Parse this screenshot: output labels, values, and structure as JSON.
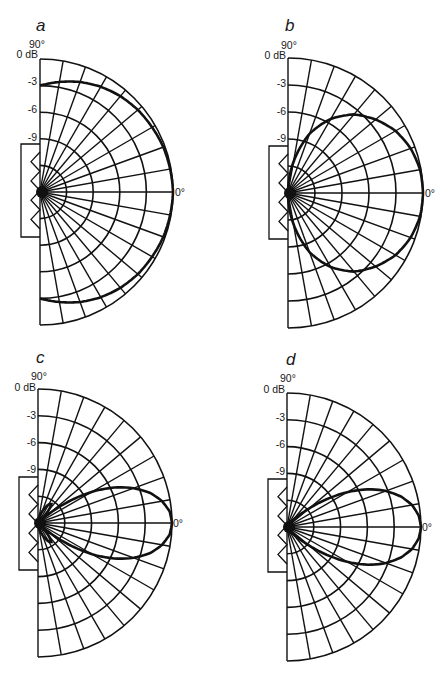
{
  "chart_data": [
    {
      "type": "polar-line",
      "panel": "a",
      "title": "a",
      "angle_labels": {
        "top": "90°",
        "right": "0°"
      },
      "radial_ticks": [
        "0 dB",
        "-3",
        "-6",
        "-9"
      ],
      "radial_range_db": [
        -15,
        0
      ],
      "spoke_spacing_deg": 10,
      "angles_deg": [
        0,
        10,
        20,
        30,
        40,
        50,
        60,
        70,
        80,
        90
      ],
      "values_db": [
        0,
        -0.1,
        -0.2,
        -0.4,
        -0.6,
        -0.9,
        -1.3,
        -1.8,
        -2.4,
        -3.0
      ],
      "geometry": {
        "cx": 40,
        "cy": 192,
        "r": 133,
        "box": [
          21,
          144,
          19,
          93
        ]
      }
    },
    {
      "type": "polar-line",
      "panel": "b",
      "title": "b",
      "angle_labels": {
        "top": "90°",
        "right": "0°"
      },
      "radial_ticks": [
        "0 dB",
        "-3",
        "-6",
        "-9"
      ],
      "radial_range_db": [
        -15,
        0
      ],
      "spoke_spacing_deg": 10,
      "angles_deg": [
        0,
        10,
        20,
        30,
        40,
        50,
        60,
        70,
        80,
        90
      ],
      "values_db": [
        0,
        -0.1,
        -0.5,
        -1.2,
        -2.3,
        -3.6,
        -5.5,
        -8.0,
        -11.5,
        -15
      ],
      "geometry": {
        "cx": 288,
        "cy": 193,
        "r": 135,
        "box": [
          269,
          146,
          19,
          93
        ]
      }
    },
    {
      "type": "polar-line",
      "panel": "c",
      "title": "c",
      "angle_labels": {
        "top": "90°",
        "right": "0°"
      },
      "radial_ticks": [
        "0 dB",
        "-3",
        "-6",
        "-9"
      ],
      "radial_range_db": [
        -15,
        0
      ],
      "spoke_spacing_deg": 10,
      "angles_deg": [
        0,
        5,
        10,
        15,
        20,
        25,
        30,
        35,
        40,
        45,
        50,
        55,
        60,
        70,
        80,
        90
      ],
      "values_db": [
        0,
        -0.2,
        -0.9,
        -2.0,
        -3.6,
        -5.6,
        -8.0,
        -10.8,
        -13.5,
        -15,
        -13.2,
        -12.4,
        -12.6,
        -13.6,
        -14.4,
        -15
      ],
      "geometry": {
        "cx": 38,
        "cy": 523,
        "r": 134,
        "box": [
          19,
          477,
          19,
          93
        ]
      }
    },
    {
      "type": "polar-line",
      "panel": "d",
      "title": "d",
      "angle_labels": {
        "top": "90°",
        "right": "0°"
      },
      "radial_ticks": [
        "0 dB",
        "-3",
        "-6",
        "-9"
      ],
      "radial_range_db": [
        -15,
        0
      ],
      "spoke_spacing_deg": 10,
      "angles_deg": [
        0,
        5,
        10,
        15,
        20,
        25,
        30,
        35,
        40,
        45,
        50,
        60,
        70,
        80,
        90
      ],
      "values_db": [
        0,
        -0.2,
        -0.8,
        -1.8,
        -3.2,
        -5.0,
        -7.2,
        -9.6,
        -11.8,
        -13.4,
        -14.2,
        -14.7,
        -14.9,
        -15,
        -15
      ],
      "geometry": {
        "cx": 287,
        "cy": 527,
        "r": 134,
        "box": [
          268,
          479,
          19,
          93
        ]
      }
    }
  ],
  "panels": {
    "a": {
      "label": "a",
      "top": "90°",
      "right": "0°",
      "ticks": [
        "0 dB",
        "-3",
        "-6",
        "-9"
      ]
    },
    "b": {
      "label": "b",
      "top": "90°",
      "right": "0°",
      "ticks": [
        "0 dB",
        "-3",
        "-6",
        "-9"
      ]
    },
    "c": {
      "label": "c",
      "top": "90°",
      "right": "0°",
      "ticks": [
        "0 dB",
        "-3",
        "-6",
        "-9"
      ]
    },
    "d": {
      "label": "d",
      "top": "90°",
      "right": "0°",
      "ticks": [
        "0 dB",
        "-3",
        "-6",
        "-9"
      ]
    }
  }
}
